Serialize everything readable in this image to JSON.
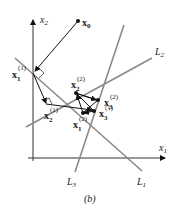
{
  "figure": {
    "caption": "(b)",
    "axes": {
      "x_label": "x",
      "x_sub": "1",
      "y_label": "x",
      "y_sub": "2"
    },
    "lines": [
      {
        "name": "L",
        "sub": "1"
      },
      {
        "name": "L",
        "sub": "2"
      },
      {
        "name": "L",
        "sub": "3"
      }
    ],
    "points": [
      {
        "base": "x",
        "sub": "0",
        "sup": ""
      },
      {
        "base": "x",
        "sub": "1",
        "sup": "(1)"
      },
      {
        "base": "x",
        "sub": "2",
        "sup": "(1)"
      },
      {
        "base": "x",
        "sub": "3",
        "sup": "(1)"
      },
      {
        "base": "x",
        "sub": "1",
        "sup": "(2)"
      },
      {
        "base": "x",
        "sub": "2",
        "sup": "(2)"
      },
      {
        "base": "x",
        "sub": "3",
        "sup": "(2)"
      }
    ],
    "colors": {
      "line": "#8a8a8a",
      "axis": "#333333",
      "path": "#111111"
    }
  }
}
